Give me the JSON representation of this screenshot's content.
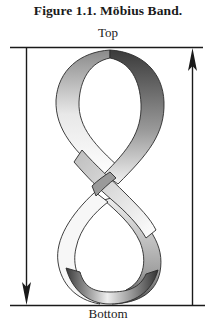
{
  "figure": {
    "caption": "Figure 1.1.  Möbius Band.",
    "label_top": "Top",
    "label_bottom": "Bottom",
    "arrows": [
      {
        "side": "left",
        "direction": "down"
      },
      {
        "side": "right",
        "direction": "up"
      }
    ],
    "colors": {
      "line": "#1a1a1a",
      "band_light": "#f4f4f4",
      "band_dark": "#555555"
    }
  }
}
